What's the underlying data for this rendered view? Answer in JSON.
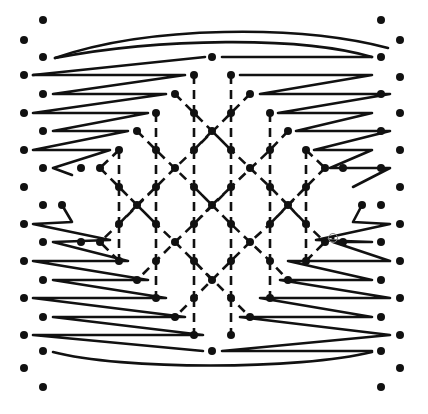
{
  "diagram": {
    "title": "",
    "type": "bobbin-lace-pricking",
    "colors": {
      "ink": "#111111",
      "background": "#ffffff"
    },
    "edge_pins": {
      "left_outer_x": 24,
      "left_inner_x": 43,
      "right_outer_x": 400,
      "right_inner_x": 381,
      "left_outer_y": [
        40,
        75,
        113,
        150,
        187,
        224,
        261,
        298,
        335,
        368
      ],
      "left_inner_y": [
        20,
        57,
        94,
        131,
        168,
        205,
        242,
        280,
        317,
        351,
        387
      ],
      "right_outer_y": [
        40,
        75,
        113,
        150,
        187,
        224,
        261,
        298,
        335,
        368
      ],
      "right_inner_y": [
        20,
        57,
        94,
        131,
        168,
        205,
        242,
        280,
        317,
        351,
        387
      ]
    },
    "lattice_pins": [
      [
        212,
        57
      ],
      [
        194,
        75
      ],
      [
        231,
        75
      ],
      [
        175,
        94
      ],
      [
        250,
        94
      ],
      [
        156,
        113
      ],
      [
        194,
        113
      ],
      [
        231,
        113
      ],
      [
        270,
        113
      ],
      [
        137,
        131
      ],
      [
        212,
        131
      ],
      [
        288,
        131
      ],
      [
        119,
        150
      ],
      [
        156,
        150
      ],
      [
        194,
        150
      ],
      [
        231,
        150
      ],
      [
        270,
        150
      ],
      [
        306,
        150
      ],
      [
        100,
        168
      ],
      [
        175,
        168
      ],
      [
        250,
        168
      ],
      [
        325,
        168
      ],
      [
        119,
        187
      ],
      [
        156,
        187
      ],
      [
        194,
        187
      ],
      [
        231,
        187
      ],
      [
        270,
        187
      ],
      [
        306,
        187
      ],
      [
        137,
        205
      ],
      [
        212,
        205
      ],
      [
        288,
        205
      ],
      [
        119,
        224
      ],
      [
        156,
        224
      ],
      [
        194,
        224
      ],
      [
        231,
        224
      ],
      [
        270,
        224
      ],
      [
        306,
        224
      ],
      [
        100,
        242
      ],
      [
        175,
        242
      ],
      [
        250,
        242
      ],
      [
        325,
        242
      ],
      [
        119,
        261
      ],
      [
        156,
        261
      ],
      [
        194,
        261
      ],
      [
        231,
        261
      ],
      [
        270,
        261
      ],
      [
        306,
        261
      ],
      [
        137,
        280
      ],
      [
        212,
        280
      ],
      [
        288,
        280
      ],
      [
        156,
        298
      ],
      [
        194,
        298
      ],
      [
        231,
        298
      ],
      [
        270,
        298
      ],
      [
        175,
        317
      ],
      [
        250,
        317
      ],
      [
        194,
        335
      ],
      [
        231,
        335
      ],
      [
        212,
        351
      ]
    ],
    "inner_edge_pins": [
      [
        81,
        168
      ],
      [
        62,
        205
      ],
      [
        81,
        242
      ],
      [
        343,
        168
      ],
      [
        362,
        205
      ],
      [
        343,
        242
      ],
      [
        62,
        187
      ],
      [
        362,
        187
      ]
    ],
    "marked_pin": {
      "x": 333,
      "y": 238,
      "label": "start-ring"
    }
  }
}
